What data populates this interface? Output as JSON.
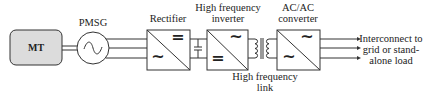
{
  "diagram": {
    "blocks": {
      "mt": {
        "label": "MT"
      },
      "pmsg": {
        "label": "PMSG"
      },
      "rectifier": {
        "label": "Rectifier",
        "top_symbol": "=",
        "bottom_symbol": "~"
      },
      "hf_inverter": {
        "label_line1": "High frequency",
        "label_line2": "inverter",
        "top_symbol": "~",
        "bottom_symbol": "="
      },
      "acac": {
        "label_line1": "AC/AC",
        "label_line2": "converter",
        "top_symbol": "~",
        "bottom_symbol": "~"
      }
    },
    "hf_link": {
      "line1": "High frequency",
      "line2": "link"
    },
    "output": {
      "line1": "Interconnect to",
      "line2": "grid or stand-",
      "line3": "alone load"
    },
    "colors": {
      "mt_fill": "#dcdcdc",
      "stroke": "#333333"
    }
  }
}
